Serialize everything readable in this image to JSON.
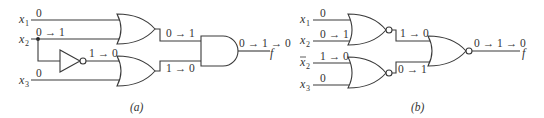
{
  "figure": {
    "panel_a": {
      "caption": "(a)",
      "inputs": [
        {
          "name": "x",
          "sub": "1",
          "value": "0"
        },
        {
          "name": "x",
          "sub": "2",
          "value": "0 → 1"
        },
        {
          "name": "x",
          "sub": "3",
          "value": "0"
        }
      ],
      "inverter_output": "1 → 0",
      "or_gate_1_output": "0 → 1",
      "or_gate_2_output": "1 → 0",
      "and_output": "0 → 1 → 0",
      "output_name": "f",
      "gates": [
        "OR",
        "NOT",
        "OR",
        "AND"
      ]
    },
    "panel_b": {
      "caption": "(b)",
      "inputs": [
        {
          "name": "x",
          "sub": "1",
          "value": "0",
          "bar": false
        },
        {
          "name": "x",
          "sub": "2",
          "value": "0 → 1",
          "bar": false
        },
        {
          "name": "x",
          "sub": "2",
          "value": "1 → 0",
          "bar": true
        },
        {
          "name": "x",
          "sub": "3",
          "value": "0",
          "bar": false
        }
      ],
      "nor_gate_1_output": "1 → 0",
      "nor_gate_2_output": "0 → 1",
      "final_nor_output": "0 → 1 → 0",
      "output_name": "f",
      "gates": [
        "NOR",
        "NOR",
        "NOR"
      ]
    }
  }
}
